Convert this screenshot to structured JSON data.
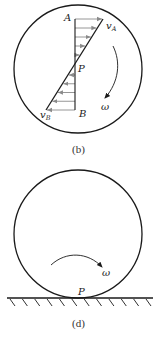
{
  "figure_b": {
    "caption": "(b)",
    "labels": {
      "point_top": "A",
      "point_center": "P",
      "point_bottom": "B",
      "velocity_top": "v",
      "velocity_top_sub": "A",
      "velocity_bottom": "v",
      "velocity_bottom_sub": "B",
      "angular_velocity": "ω"
    },
    "velocity_arrows_top_count": 5,
    "velocity_arrows_bottom_count": 5,
    "rotation_direction": "clockwise"
  },
  "figure_d": {
    "caption": "(d)",
    "labels": {
      "contact_point": "P",
      "angular_velocity": "ω"
    },
    "rotation_direction": "clockwise",
    "ground_hatch_count": 12
  },
  "colors": {
    "outline": "#1a1a1a",
    "velocity_arrow": "#8a8a8a"
  }
}
